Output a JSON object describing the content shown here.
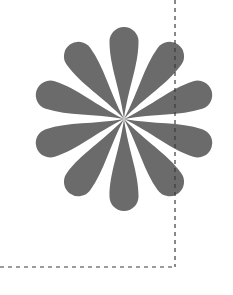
{
  "canvas": {
    "width": 233,
    "height": 295,
    "background_color": "#ffffff"
  },
  "figure": {
    "name": "flower-rosette",
    "center_x": 124,
    "center_y": 119,
    "petal_count": 10,
    "petal_color": "#6b6b6b",
    "petal_length": 92,
    "petal_width": 29,
    "petal_tip_radius": 14.5,
    "start_angle_deg": -90,
    "angle_step_deg": 36,
    "petal_angles_deg": [
      -90,
      -54,
      -18,
      18,
      54,
      90,
      126,
      162,
      198,
      234
    ]
  },
  "guides": {
    "color": "#3a3a3a",
    "stroke_width": 1.2,
    "dash_pattern": "4 4",
    "vertical_line": {
      "name": "vertical-crop-guide",
      "x": 175,
      "y1": 0,
      "y2": 267
    },
    "horizontal_line": {
      "name": "horizontal-crop-guide",
      "y": 267,
      "x1": 0,
      "x2": 175
    }
  }
}
